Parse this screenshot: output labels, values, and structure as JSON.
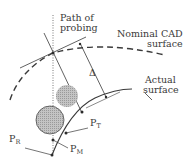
{
  "labels": {
    "path_line1": "Path of",
    "path_line2": "probing",
    "nominal_line1": "Nominal CAD",
    "nominal_line2": "surface",
    "actual_line1": "Actual",
    "actual_line2": "surface",
    "delta": "Δ",
    "pt_main": "P",
    "pt_sub": "T",
    "pm_main": "P",
    "pm_sub": "M",
    "pr_main": "P",
    "pr_sub": "R"
  },
  "colors": {
    "line": "#3a3a3a",
    "shade": "#b8b8b8",
    "background": "#ffffff"
  }
}
